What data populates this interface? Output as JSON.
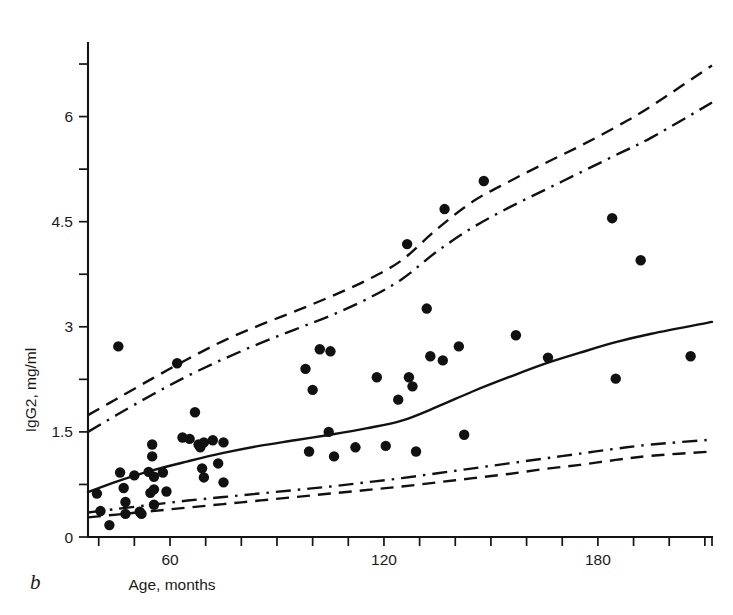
{
  "figure": {
    "panel_label": "b",
    "background_color": "#ffffff",
    "ink_color": "#111111"
  },
  "chart_data": {
    "type": "scatter",
    "title": "",
    "subtitle": "",
    "xlabel": "Age, months",
    "ylabel": "IgG2, mg/ml",
    "xlim": [
      37,
      212
    ],
    "ylim": [
      0,
      6.95
    ],
    "grid": false,
    "legend_position": "none",
    "x_ticks_labeled": [
      60,
      120,
      180
    ],
    "x_tick_labels": [
      "60",
      "120",
      "180"
    ],
    "x_ticks_minor_step": 10,
    "y_ticks_labeled": [
      0,
      1.5,
      3,
      4.5,
      6
    ],
    "y_tick_labels": [
      "0",
      "1.5",
      "3",
      "4.5",
      "6"
    ],
    "y_ticks_minor": [
      0.75,
      2.25,
      3.75,
      5.25,
      6.75
    ],
    "points_label": "individual IgG2 measurements",
    "points": [
      [
        39.5,
        0.62
      ],
      [
        40.5,
        0.37
      ],
      [
        43.0,
        0.17
      ],
      [
        45.5,
        2.72
      ],
      [
        46.0,
        0.92
      ],
      [
        47.0,
        0.7
      ],
      [
        47.5,
        0.5
      ],
      [
        47.5,
        0.33
      ],
      [
        50.0,
        0.88
      ],
      [
        51.5,
        0.36
      ],
      [
        52.0,
        0.33
      ],
      [
        54.0,
        0.93
      ],
      [
        54.5,
        0.63
      ],
      [
        55.0,
        1.32
      ],
      [
        55.0,
        1.15
      ],
      [
        55.5,
        0.86
      ],
      [
        55.5,
        0.68
      ],
      [
        55.5,
        0.46
      ],
      [
        58.0,
        0.92
      ],
      [
        59.0,
        0.65
      ],
      [
        62.0,
        2.48
      ],
      [
        63.5,
        1.42
      ],
      [
        65.5,
        1.4
      ],
      [
        67.0,
        1.78
      ],
      [
        68.0,
        1.32
      ],
      [
        68.5,
        1.28
      ],
      [
        69.0,
        0.98
      ],
      [
        69.5,
        1.35
      ],
      [
        69.5,
        0.85
      ],
      [
        72.0,
        1.38
      ],
      [
        73.5,
        1.05
      ],
      [
        75.0,
        1.35
      ],
      [
        75.0,
        0.78
      ],
      [
        98.0,
        2.4
      ],
      [
        99.0,
        1.22
      ],
      [
        100.0,
        2.1
      ],
      [
        102.0,
        2.68
      ],
      [
        104.5,
        1.5
      ],
      [
        105.0,
        2.65
      ],
      [
        106.0,
        1.15
      ],
      [
        112.0,
        1.28
      ],
      [
        118.0,
        2.28
      ],
      [
        120.5,
        1.3
      ],
      [
        124.0,
        1.96
      ],
      [
        126.5,
        4.18
      ],
      [
        127.0,
        2.28
      ],
      [
        128.0,
        2.15
      ],
      [
        129.0,
        1.22
      ],
      [
        132.0,
        3.26
      ],
      [
        133.0,
        2.58
      ],
      [
        136.5,
        2.52
      ],
      [
        137.0,
        4.68
      ],
      [
        141.0,
        2.72
      ],
      [
        142.5,
        1.46
      ],
      [
        148.0,
        5.08
      ],
      [
        157.0,
        2.88
      ],
      [
        166.0,
        2.56
      ],
      [
        184.0,
        4.55
      ],
      [
        185.0,
        2.26
      ],
      [
        192.0,
        3.95
      ],
      [
        206.0,
        2.58
      ]
    ],
    "curves": [
      {
        "name": "median",
        "style": "solid",
        "x": [
          37,
          45,
          55,
          65,
          75,
          85,
          95,
          105,
          115,
          125,
          135,
          145,
          155,
          165,
          175,
          185,
          195,
          212
        ],
        "y": [
          0.64,
          0.79,
          0.95,
          1.08,
          1.2,
          1.3,
          1.38,
          1.46,
          1.55,
          1.66,
          1.86,
          2.08,
          2.28,
          2.47,
          2.63,
          2.78,
          2.9,
          3.07
        ]
      },
      {
        "name": "upper-outer",
        "style": "dashed",
        "x": [
          37,
          45,
          55,
          65,
          75,
          85,
          95,
          105,
          115,
          125,
          135,
          145,
          155,
          165,
          175,
          185,
          195,
          212
        ],
        "y": [
          1.74,
          1.97,
          2.26,
          2.54,
          2.8,
          3.02,
          3.22,
          3.43,
          3.66,
          3.95,
          4.4,
          4.79,
          5.07,
          5.33,
          5.58,
          5.85,
          6.15,
          6.73
        ]
      },
      {
        "name": "upper-inner",
        "style": "dash-dot",
        "x": [
          37,
          45,
          55,
          65,
          75,
          85,
          95,
          105,
          115,
          125,
          135,
          145,
          155,
          165,
          175,
          185,
          195,
          212
        ],
        "y": [
          1.5,
          1.74,
          2.03,
          2.3,
          2.54,
          2.76,
          2.96,
          3.16,
          3.39,
          3.68,
          4.08,
          4.42,
          4.7,
          4.95,
          5.2,
          5.45,
          5.7,
          6.2
        ]
      },
      {
        "name": "lower-inner",
        "style": "dash-dot",
        "x": [
          37,
          45,
          55,
          65,
          75,
          85,
          95,
          105,
          115,
          125,
          135,
          145,
          155,
          165,
          175,
          185,
          195,
          212
        ],
        "y": [
          0.35,
          0.4,
          0.46,
          0.52,
          0.57,
          0.62,
          0.67,
          0.72,
          0.78,
          0.84,
          0.91,
          0.98,
          1.05,
          1.12,
          1.19,
          1.26,
          1.32,
          1.39
        ]
      },
      {
        "name": "lower-outer",
        "style": "dashed",
        "x": [
          37,
          45,
          55,
          65,
          75,
          85,
          95,
          105,
          115,
          125,
          135,
          145,
          155,
          165,
          175,
          185,
          195,
          212
        ],
        "y": [
          0.28,
          0.32,
          0.37,
          0.42,
          0.47,
          0.52,
          0.57,
          0.62,
          0.67,
          0.72,
          0.78,
          0.84,
          0.9,
          0.97,
          1.03,
          1.1,
          1.16,
          1.22
        ]
      }
    ]
  },
  "geometry": {
    "plot_left_px": 88,
    "plot_right_px": 712,
    "plot_bottom_px": 537,
    "plot_top_px": 43,
    "x_min": 37,
    "x_max": 212,
    "y_min": 0,
    "y_max": 7.05,
    "point_radius_px": 5.2
  }
}
